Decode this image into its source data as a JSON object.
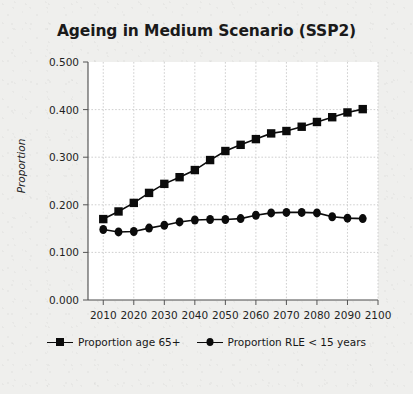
{
  "figure": {
    "title": "Ageing in Medium Scenario (SSP2)",
    "background_color": "#efefed",
    "plot_background_color": "#ffffff",
    "ink_color": "#0b0b0b",
    "grid_color": "#c9c9c9"
  },
  "axes": {
    "y_title": "Proportion",
    "y_ticks": [
      "0.000",
      "0.100",
      "0.200",
      "0.300",
      "0.400",
      "0.500"
    ],
    "x_ticks": [
      "2010",
      "2020",
      "2030",
      "2040",
      "2050",
      "2060",
      "2070",
      "2080",
      "2090",
      "2100"
    ]
  },
  "legend": {
    "items": [
      {
        "label": "Proportion age 65+",
        "marker": "square-marker"
      },
      {
        "label": "Proportion RLE < 15 years",
        "marker": "diamond-marker"
      }
    ]
  },
  "chart_data": {
    "type": "line",
    "title": "Ageing in Medium Scenario (SSP2)",
    "xlabel": "",
    "ylabel": "Proportion",
    "xlim": [
      2005,
      2100
    ],
    "ylim": [
      0.0,
      0.5
    ],
    "grid": true,
    "legend_position": "bottom",
    "x": [
      2010,
      2015,
      2020,
      2025,
      2030,
      2035,
      2040,
      2045,
      2050,
      2055,
      2060,
      2065,
      2070,
      2075,
      2080,
      2085,
      2090,
      2095
    ],
    "series": [
      {
        "name": "Proportion age 65+",
        "marker": "square",
        "values": [
          0.17,
          0.186,
          0.204,
          0.225,
          0.244,
          0.258,
          0.273,
          0.294,
          0.313,
          0.326,
          0.338,
          0.35,
          0.355,
          0.364,
          0.374,
          0.384,
          0.394,
          0.401
        ]
      },
      {
        "name": "Proportion RLE < 15 years",
        "marker": "diamond",
        "values": [
          0.148,
          0.143,
          0.144,
          0.151,
          0.157,
          0.164,
          0.168,
          0.169,
          0.169,
          0.171,
          0.178,
          0.183,
          0.184,
          0.184,
          0.183,
          0.175,
          0.172,
          0.171
        ]
      }
    ]
  }
}
